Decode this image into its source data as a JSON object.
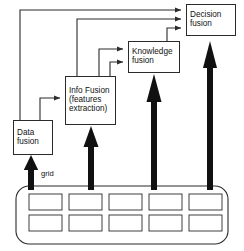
{
  "figure": {
    "type": "diagram",
    "kind": "block-flow"
  },
  "nodes": [
    {
      "id": "data-fusion",
      "lines": [
        "Data",
        "fusion"
      ],
      "x": 13,
      "y": 120,
      "w": 40,
      "h": 35
    },
    {
      "id": "info-fusion",
      "lines": [
        "Info Fusion",
        "(features",
        "extraction)"
      ],
      "x": 65,
      "y": 76,
      "w": 51,
      "h": 49
    },
    {
      "id": "knowledge-fusion",
      "lines": [
        "Knowledge",
        "fusion"
      ],
      "x": 128,
      "y": 41,
      "w": 52,
      "h": 32
    },
    {
      "id": "decision-fusion",
      "lines": [
        "Decision",
        "fusion"
      ],
      "x": 186,
      "y": 4,
      "w": 50,
      "h": 32
    }
  ],
  "grid": {
    "label": "grid",
    "columns": 5,
    "rows": 2,
    "cells": 10
  },
  "thick_arrows": [
    {
      "from": "grid",
      "to": "data-fusion",
      "x": 31
    },
    {
      "from": "grid",
      "to": "info-fusion",
      "x": 91
    },
    {
      "from": "grid",
      "to": "knowledge-fusion",
      "x": 154
    },
    {
      "from": "grid",
      "to": "decision-fusion",
      "x": 210
    }
  ],
  "thin_connectors": [
    {
      "from": "data-fusion",
      "to": "info-fusion"
    },
    {
      "from": "data-fusion",
      "to": "decision-fusion"
    },
    {
      "from": "info-fusion",
      "to": "knowledge-fusion"
    },
    {
      "from": "info-fusion",
      "to": "decision-fusion"
    },
    {
      "from": "knowledge-fusion",
      "to": "decision-fusion"
    }
  ],
  "colors": {
    "stroke": "#2b2b2b",
    "thick_arrow": "#111111",
    "background": "#ffffff",
    "text": "#111111"
  }
}
